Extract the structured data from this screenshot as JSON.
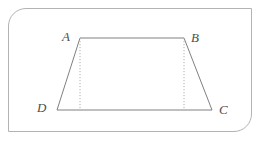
{
  "figure": {
    "kind": "isosceles-trapezoid",
    "name": "Trapezoid ABCD",
    "labels": {
      "top_left": "A",
      "top_right": "B",
      "bottom_right": "C",
      "bottom_left": "D"
    },
    "vertices": {
      "A": {
        "x": 80,
        "y": 38
      },
      "B": {
        "x": 184,
        "y": 38
      },
      "C": {
        "x": 212,
        "y": 110
      },
      "D": {
        "x": 57,
        "y": 110
      }
    },
    "sides": [
      {
        "name": "AB",
        "from": "A",
        "to": "B",
        "style": "solid",
        "role": "top-base"
      },
      {
        "name": "BC",
        "from": "B",
        "to": "C",
        "style": "solid",
        "role": "right-leg"
      },
      {
        "name": "CD",
        "from": "C",
        "to": "D",
        "style": "solid",
        "role": "bottom-base"
      },
      {
        "name": "DA",
        "from": "D",
        "to": "A",
        "style": "solid",
        "role": "left-leg"
      }
    ],
    "altitudes": [
      {
        "name": "altitude-from-A",
        "from": "A",
        "foot": {
          "x": 80,
          "y": 110
        },
        "style": "dotted"
      },
      {
        "name": "altitude-from-B",
        "from": "B",
        "foot": {
          "x": 184,
          "y": 110
        },
        "style": "dotted"
      }
    ],
    "colors": {
      "shape_stroke": "#808080",
      "altitude_stroke": "#b0b0b0",
      "frame_stroke": "#b3b3b3",
      "label_text": "#4d4d4d",
      "background": "#ffffff",
      "shape_fill": "none"
    },
    "frame": {
      "rounded_corners": [
        "top-left",
        "bottom-right"
      ],
      "square_corners": [
        "top-right",
        "bottom-left"
      ]
    }
  }
}
